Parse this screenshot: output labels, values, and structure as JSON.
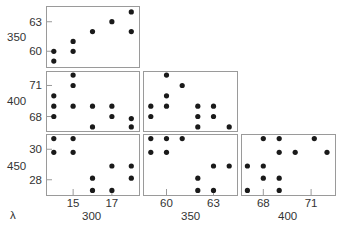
{
  "chart_data": {
    "type": "scatter",
    "layout": "scatter-plot-matrix (lower triangle)",
    "title": "",
    "corner_label": "λ",
    "variables": [
      "300",
      "350",
      "400",
      "450"
    ],
    "column_labels": [
      "300",
      "350",
      "400"
    ],
    "row_labels": [
      "350",
      "400",
      "450"
    ],
    "grid": false,
    "point_color": "#1a1a1a",
    "frame_color": "#9a9a9a",
    "columns": [
      {
        "label": "300",
        "range": [
          13.6,
          18.4
        ],
        "ticks": [
          15,
          17
        ],
        "px": [
          46,
          139
        ]
      },
      {
        "label": "350",
        "range": [
          58.5,
          64.5
        ],
        "ticks": [
          60,
          63
        ],
        "px": [
          143,
          237
        ]
      },
      {
        "label": "400",
        "range": [
          66.6,
          72.5
        ],
        "ticks": [
          68,
          71
        ],
        "px": [
          241,
          335
        ]
      }
    ],
    "rows": [
      {
        "label": "350",
        "range": [
          58.4,
          64.6
        ],
        "ticks": [
          60,
          63
        ],
        "px": [
          6,
          67
        ]
      },
      {
        "label": "400",
        "range": [
          66.6,
          72.4
        ],
        "ticks": [
          68,
          71
        ],
        "px": [
          71,
          131
        ]
      },
      {
        "label": "450",
        "range": [
          27.0,
          31.0
        ],
        "ticks": [
          28,
          30
        ],
        "px": [
          134,
          195
        ]
      }
    ],
    "panels": [
      {
        "row": 0,
        "col": 0,
        "x_var": "300",
        "y_var": "350",
        "points": [
          [
            14,
            60
          ],
          [
            14,
            59
          ],
          [
            15,
            61
          ],
          [
            15,
            60
          ],
          [
            16,
            62
          ],
          [
            17,
            63
          ],
          [
            18,
            64
          ],
          [
            18,
            62
          ]
        ]
      },
      {
        "row": 1,
        "col": 0,
        "x_var": "300",
        "y_var": "400",
        "points": [
          [
            14,
            70
          ],
          [
            14,
            69
          ],
          [
            14,
            68
          ],
          [
            15,
            72
          ],
          [
            15,
            71
          ],
          [
            15,
            69
          ],
          [
            16,
            69
          ],
          [
            16,
            67
          ],
          [
            17,
            69
          ],
          [
            17,
            68
          ],
          [
            18,
            67.8
          ],
          [
            18,
            67
          ]
        ]
      },
      {
        "row": 1,
        "col": 1,
        "x_var": "350",
        "y_var": "400",
        "points": [
          [
            59,
            69
          ],
          [
            59,
            68
          ],
          [
            60,
            72
          ],
          [
            60,
            70
          ],
          [
            60,
            69
          ],
          [
            61,
            71
          ],
          [
            62,
            69
          ],
          [
            62,
            68
          ],
          [
            62,
            67
          ],
          [
            63,
            69
          ],
          [
            63,
            68
          ],
          [
            64,
            67
          ]
        ]
      },
      {
        "row": 2,
        "col": 0,
        "x_var": "300",
        "y_var": "450",
        "points": [
          [
            14,
            30.7
          ],
          [
            14,
            29.8
          ],
          [
            15,
            30.7
          ],
          [
            15,
            29.8
          ],
          [
            16,
            28.1
          ],
          [
            16,
            27.3
          ],
          [
            17,
            28.9
          ],
          [
            17,
            27.3
          ],
          [
            18,
            28.9
          ],
          [
            18,
            28.1
          ]
        ]
      },
      {
        "row": 2,
        "col": 1,
        "x_var": "350",
        "y_var": "450",
        "points": [
          [
            59,
            30.7
          ],
          [
            59,
            29.8
          ],
          [
            60,
            30.7
          ],
          [
            60,
            29.8
          ],
          [
            61,
            30.7
          ],
          [
            62,
            28.1
          ],
          [
            62,
            27.3
          ],
          [
            63,
            28.9
          ],
          [
            63,
            27.3
          ],
          [
            64,
            28.9
          ]
        ]
      },
      {
        "row": 2,
        "col": 2,
        "x_var": "400",
        "y_var": "450",
        "points": [
          [
            68,
            30.7
          ],
          [
            69,
            30.7
          ],
          [
            71.2,
            30.7
          ],
          [
            69,
            29.8
          ],
          [
            70,
            29.8
          ],
          [
            72,
            29.8
          ],
          [
            67,
            28.9
          ],
          [
            68,
            28.9
          ],
          [
            68,
            28.1
          ],
          [
            69,
            28.1
          ],
          [
            67,
            27.3
          ],
          [
            69,
            27.3
          ]
        ]
      }
    ]
  }
}
